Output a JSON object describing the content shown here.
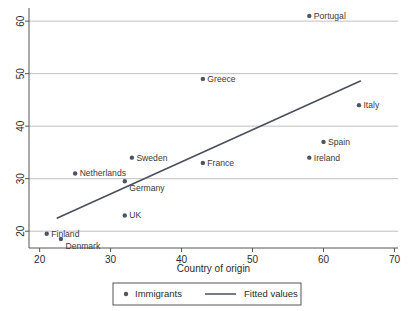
{
  "chart_data": {
    "type": "scatter",
    "title": "",
    "subtitle": "",
    "xlabel": "Country of origin",
    "ylabel": "",
    "xlim": [
      18.5,
      70.5
    ],
    "ylim": [
      16.8,
      62.5
    ],
    "xticks": [
      20,
      30,
      40,
      50,
      60,
      70
    ],
    "yticks": [
      20,
      30,
      40,
      50,
      60
    ],
    "xticklabels": [
      "20",
      "30",
      "40",
      "50",
      "60",
      "70"
    ],
    "yticklabels": [
      "20",
      "30",
      "40",
      "50",
      "60"
    ],
    "grid": "horizontal",
    "grid_values": [
      20,
      30,
      40,
      50,
      60
    ],
    "legend_position": "below-axis",
    "marker_color": "#4d5565",
    "line_color": "#4a4f5c",
    "grid_color": "#b9b9b9",
    "axis_color": "#555555",
    "series": [
      {
        "name": "Immigrants",
        "type": "scatter",
        "points": [
          {
            "label": "Portugal",
            "x": 58.0,
            "y": 61.0,
            "label_pos": "right"
          },
          {
            "label": "Greece",
            "x": 43.0,
            "y": 49.0,
            "label_pos": "right"
          },
          {
            "label": "Italy",
            "x": 65.0,
            "y": 44.0,
            "label_pos": "right"
          },
          {
            "label": "Spain",
            "x": 60.0,
            "y": 37.0,
            "label_pos": "right"
          },
          {
            "label": "Ireland",
            "x": 58.0,
            "y": 34.0,
            "label_pos": "right"
          },
          {
            "label": "Sweden",
            "x": 33.0,
            "y": 34.0,
            "label_pos": "right"
          },
          {
            "label": "France",
            "x": 43.0,
            "y": 33.0,
            "label_pos": "right"
          },
          {
            "label": "Netherlands",
            "x": 25.0,
            "y": 31.0,
            "label_pos": "right"
          },
          {
            "label": "Germany",
            "x": 32.0,
            "y": 29.5,
            "label_pos": "below-right"
          },
          {
            "label": "UK",
            "x": 32.0,
            "y": 23.0,
            "label_pos": "right"
          },
          {
            "label": "Finland",
            "x": 21.0,
            "y": 19.5,
            "label_pos": "right"
          },
          {
            "label": "Denmark",
            "x": 23.0,
            "y": 18.5,
            "label_pos": "below-right"
          }
        ]
      },
      {
        "name": "Fitted values",
        "type": "line",
        "x": [
          22.5,
          65.2
        ],
        "y": [
          22.5,
          48.6
        ]
      }
    ]
  },
  "legend": {
    "items": [
      {
        "label": "Immigrants",
        "marker": "dot-marker"
      },
      {
        "label": "Fitted values",
        "marker": "line-marker"
      }
    ]
  },
  "axes": {
    "x_title": "Country of origin",
    "y_title": ""
  }
}
